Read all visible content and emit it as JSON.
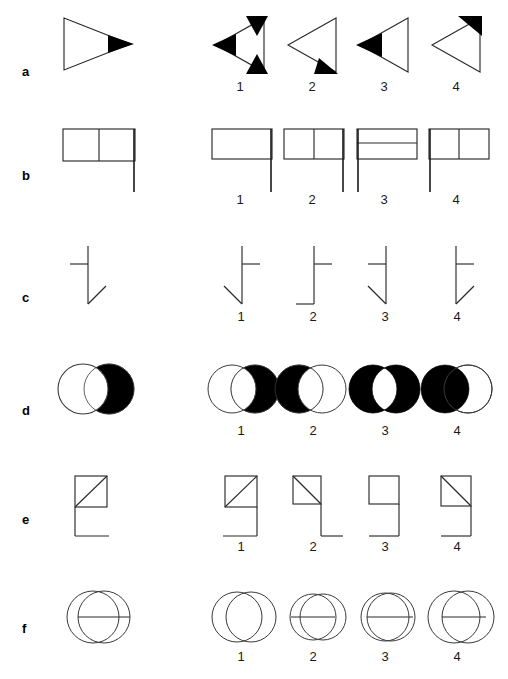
{
  "page": {
    "background_color": "#ffffff",
    "ink_color": "#000000",
    "line_color": "#2b2b2b",
    "option_numbers": [
      "1",
      "2",
      "3",
      "4"
    ]
  },
  "rows": [
    {
      "label": "a",
      "model": {
        "name": "right-pointing-triangle-with-black-tip-at-right-vertex",
        "description": "Outlined triangle pointing right with a small solid black triangle at its right vertex"
      },
      "options": [
        {
          "number": "1",
          "name": "left-pointing-triangle-black-tips-all-three-vertices",
          "description": "Outlined triangle pointing left with solid black triangles at all three vertices"
        },
        {
          "number": "2",
          "name": "left-pointing-triangle-black-tip-bottom-right",
          "description": "Outlined triangle pointing left with a solid black triangle at the bottom-right vertex"
        },
        {
          "number": "3",
          "name": "left-pointing-triangle-black-tip-left",
          "description": "Outlined triangle pointing left with a solid black triangle at the left vertex"
        },
        {
          "number": "4",
          "name": "left-pointing-triangle-black-tip-top-right",
          "description": "Outlined triangle pointing left with a solid black triangle at the top-right vertex"
        }
      ]
    },
    {
      "label": "b",
      "model": {
        "name": "flag-rectangle-vertical-divider-pole-right",
        "description": "Rectangle split by a vertical centre line with a pole descending from the right edge"
      },
      "options": [
        {
          "number": "1",
          "name": "flag-rectangle-plain-pole-right",
          "description": "Plain rectangle with a pole descending from the right edge"
        },
        {
          "number": "2",
          "name": "flag-rectangle-vertical-divider-pole-right",
          "description": "Rectangle split by a vertical centre line with a pole descending from the right edge"
        },
        {
          "number": "3",
          "name": "flag-rectangle-horizontal-divider-pole-left",
          "description": "Rectangle split by a horizontal centre line with a pole descending from the left edge"
        },
        {
          "number": "4",
          "name": "flag-rectangle-vertical-divider-pole-left",
          "description": "Rectangle split by a vertical centre line with a pole descending from the left edge"
        }
      ]
    },
    {
      "label": "c",
      "model": {
        "name": "vertical-line-left-stub-top-diagonal-up-right-bottom",
        "description": "Vertical line with a short horizontal stub to the left near the top and a diagonal rising to the right from the bottom"
      },
      "options": [
        {
          "number": "1",
          "name": "vertical-line-right-stub-top-diagonal-up-left-bottom",
          "description": "Vertical line with a stub to the right near the top and a diagonal rising to the left from the bottom"
        },
        {
          "number": "2",
          "name": "vertical-line-right-stub-top-horizontal-foot-left-bottom",
          "description": "Vertical line with a stub to the right near the top and a horizontal foot to the left at the bottom"
        },
        {
          "number": "3",
          "name": "vertical-line-left-stub-top-diagonal-up-left-bottom",
          "description": "Vertical line with a stub to the left near the top and a diagonal rising to the left from the bottom"
        },
        {
          "number": "4",
          "name": "vertical-line-right-stub-top-diagonal-up-right-bottom",
          "description": "Vertical line with a stub to the right near the top and a diagonal rising to the right from the bottom"
        }
      ]
    },
    {
      "label": "d",
      "model": {
        "name": "two-circles-right-circle-black-except-lens",
        "description": "Two overlapping circles; the right circle filled black except the overlapping lens which is white"
      },
      "options": [
        {
          "number": "1",
          "name": "two-circles-right-circle-black-except-lens",
          "description": "Right circle black except the overlapping lens, left circle outlined"
        },
        {
          "number": "2",
          "name": "two-circles-left-circle-black-except-lens",
          "description": "Left circle black except the overlapping lens, right circle outlined"
        },
        {
          "number": "3",
          "name": "two-circles-both-black-white-lens",
          "description": "Both circles black with the overlapping lens left white"
        },
        {
          "number": "4",
          "name": "two-circles-left-circle-fully-black",
          "description": "Left circle fully black, right circle outlined only"
        }
      ]
    },
    {
      "label": "e",
      "model": {
        "name": "square-diagonal-up-right-with-left-vertical-and-bottom-foot",
        "description": "Small square containing a diagonal from bottom-left to top-right, with a vertical line descending from the left edge and a short foot to the right"
      },
      "options": [
        {
          "number": "1",
          "name": "square-diagonal-up-right-with-right-vertical-and-bottom-foot-left",
          "description": "Square with diagonal from bottom-left to top-right, vertical descending from the right edge and a foot to the left"
        },
        {
          "number": "2",
          "name": "square-diagonal-down-right-with-right-vertical-and-bottom-foot-right",
          "description": "Square with diagonal from top-left to bottom-right, vertical descending from the right edge and a foot to the right"
        },
        {
          "number": "3",
          "name": "plain-square-with-right-vertical-and-bottom-foot-left",
          "description": "Plain square with a vertical descending from the right edge and a foot to the left"
        },
        {
          "number": "4",
          "name": "square-diagonal-down-right-with-right-vertical-and-bottom-foot-left",
          "description": "Square with diagonal from top-left to bottom-right, vertical descending from the right edge and a foot to the left"
        }
      ]
    },
    {
      "label": "f",
      "model": {
        "name": "two-overlapping-circles-with-horizontal-chord",
        "description": "Two overlapping circles of equal size with a horizontal line across the middle of the right circle"
      },
      "options": [
        {
          "number": "1",
          "name": "two-overlapping-circles-no-chord",
          "description": "Two overlapping circles with no horizontal line"
        },
        {
          "number": "2",
          "name": "two-overlapping-circles-chord-crossing-left",
          "description": "Two overlapping circles with a horizontal line spanning the left circle"
        },
        {
          "number": "3",
          "name": "two-overlapping-circles-chord-crossing-right",
          "description": "Two overlapping circles, largely coincident, with a horizontal line across the right circle"
        },
        {
          "number": "4",
          "name": "two-overlapping-circles-wide-with-chord",
          "description": "Two widely overlapping circles with a horizontal line across the middle"
        }
      ]
    }
  ]
}
